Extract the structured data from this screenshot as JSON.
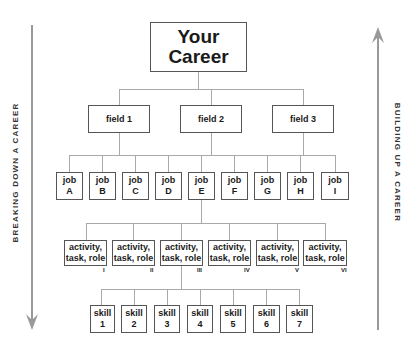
{
  "diagram": {
    "root": {
      "line1": "Your",
      "line2": "Career"
    },
    "fields": [
      "field 1",
      "field 2",
      "field 3"
    ],
    "jobs": [
      {
        "line1": "job",
        "line2": "A"
      },
      {
        "line1": "job",
        "line2": "B"
      },
      {
        "line1": "job",
        "line2": "C"
      },
      {
        "line1": "job",
        "line2": "D"
      },
      {
        "line1": "job",
        "line2": "E"
      },
      {
        "line1": "job",
        "line2": "F"
      },
      {
        "line1": "job",
        "line2": "G"
      },
      {
        "line1": "job",
        "line2": "H"
      },
      {
        "line1": "job",
        "line2": "I"
      }
    ],
    "activities": [
      {
        "line1": "activity,",
        "line2": "task, role",
        "numeral": "I"
      },
      {
        "line1": "activity,",
        "line2": "task, role",
        "numeral": "II"
      },
      {
        "line1": "activity,",
        "line2": "task, role",
        "numeral": "III"
      },
      {
        "line1": "activity,",
        "line2": "task, role",
        "numeral": "IV"
      },
      {
        "line1": "activity,",
        "line2": "task, role",
        "numeral": "V"
      },
      {
        "line1": "activity,",
        "line2": "task, role",
        "numeral": "VI"
      }
    ],
    "skills": [
      {
        "line1": "skill",
        "line2": "1"
      },
      {
        "line1": "skill",
        "line2": "2"
      },
      {
        "line1": "skill",
        "line2": "3"
      },
      {
        "line1": "skill",
        "line2": "4"
      },
      {
        "line1": "skill",
        "line2": "5"
      },
      {
        "line1": "skill",
        "line2": "6"
      },
      {
        "line1": "skill",
        "line2": "7"
      }
    ],
    "left_arrow": {
      "label": "BREAKING DOWN A CAREER",
      "direction": "down"
    },
    "right_arrow": {
      "label": "BUILDING UP A CAREER",
      "direction": "up"
    },
    "colors": {
      "box_border": "#555555",
      "connector": "#aaaaaa",
      "arrow": "#999999",
      "text": "#1a1a1a"
    }
  }
}
